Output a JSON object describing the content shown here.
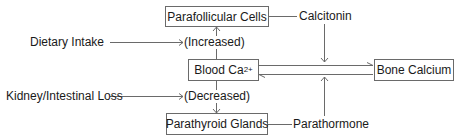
{
  "nodes": {
    "parafollicular": {
      "label": "Parafollicular Cells"
    },
    "blood_ca": {
      "label": "Blood Ca",
      "superscript": "2+"
    },
    "bone_calcium": {
      "label": "Bone Calcium"
    },
    "parathyroid": {
      "label": "Parathyroid Glands"
    }
  },
  "labels": {
    "dietary_intake": "Dietary Intake",
    "increased": "(Increased)",
    "kidney_loss": "Kidney/Intestinal Loss",
    "decreased": "(Decreased)",
    "calcitonin": "Calcitonin",
    "parathormone": "Parathormone"
  },
  "colors": {
    "line": "#6a6a6a",
    "text": "#1a1a1a",
    "background": "#ffffff"
  }
}
